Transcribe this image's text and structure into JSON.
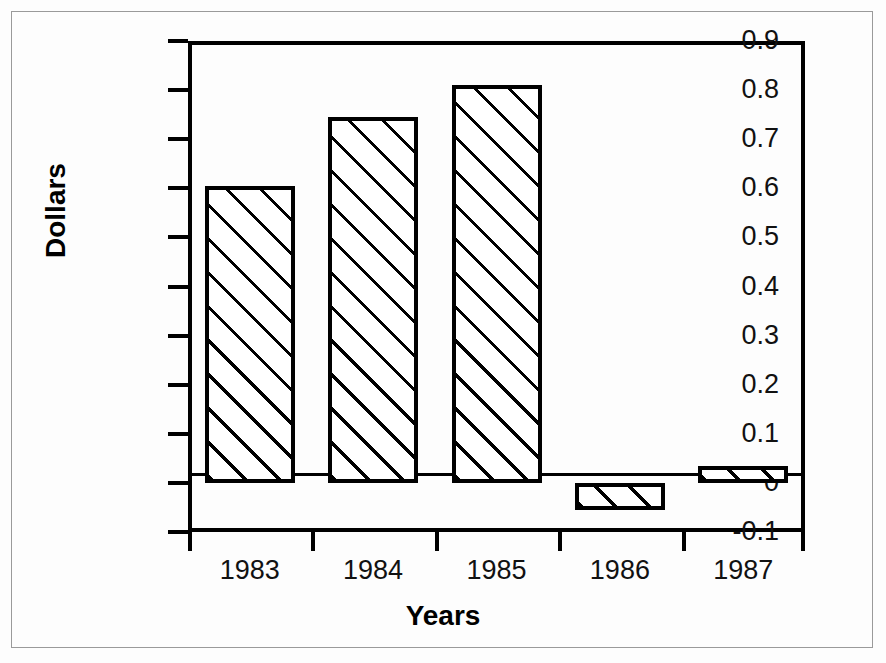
{
  "chart_data": {
    "type": "bar",
    "title": "",
    "subtitle": "",
    "xlabel": "Years",
    "ylabel": "Dollars",
    "categories": [
      "1983",
      "1984",
      "1985",
      "1986",
      "1987"
    ],
    "values": [
      0.605,
      0.745,
      0.81,
      -0.055,
      0.035
    ],
    "series": [
      {
        "name": "Dollars",
        "values": [
          0.605,
          0.745,
          0.81,
          -0.055,
          0.035
        ]
      }
    ],
    "ylim": [
      -0.1,
      0.9
    ],
    "xlim": [
      0,
      5
    ],
    "ytick_labels": [
      "0.9",
      "0.8",
      "0.7",
      "0.6",
      "0.5",
      "0.4",
      "0.3",
      "0.2",
      "0.1",
      "0",
      "-0.1"
    ],
    "ytick_values": [
      0.9,
      0.8,
      0.7,
      0.6,
      0.5,
      0.4,
      0.3,
      0.2,
      0.1,
      0,
      -0.1
    ],
    "xtick_labels": [
      "1983",
      "1984",
      "1985",
      "1986",
      "1987"
    ],
    "grid": false,
    "legend": "none",
    "bar_fill": "diagonal-hatch",
    "bar_fill_color": "#ffffff",
    "bar_edge_color": "#000000",
    "axis_color": "#000000",
    "background_color": "#fdfdfd",
    "frame_color": "#9a9a9a",
    "annotations": []
  },
  "axis_titles": {
    "y": "Dollars",
    "x": "Years"
  }
}
